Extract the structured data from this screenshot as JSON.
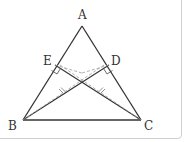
{
  "diagram": {
    "type": "geometry",
    "points": {
      "A": {
        "label": "A",
        "x": 82,
        "y": 26
      },
      "B": {
        "label": "B",
        "x": 23,
        "y": 120
      },
      "C": {
        "label": "C",
        "x": 141,
        "y": 120
      },
      "D": {
        "label": "D",
        "x": 109,
        "y": 65
      },
      "E": {
        "label": "E",
        "x": 55,
        "y": 65
      }
    },
    "solid_segments": [
      "AB",
      "AC",
      "BC",
      "BD",
      "CE"
    ],
    "right_angles": [
      "E",
      "D"
    ],
    "dashed_segments": [
      "E-center",
      "D-center",
      "B-toward-D",
      "C-toward-E"
    ],
    "equal_marks": "//",
    "colors": {
      "line": "#333333",
      "dashed": "#9a9a9a",
      "border": "#cfcfcf"
    }
  }
}
